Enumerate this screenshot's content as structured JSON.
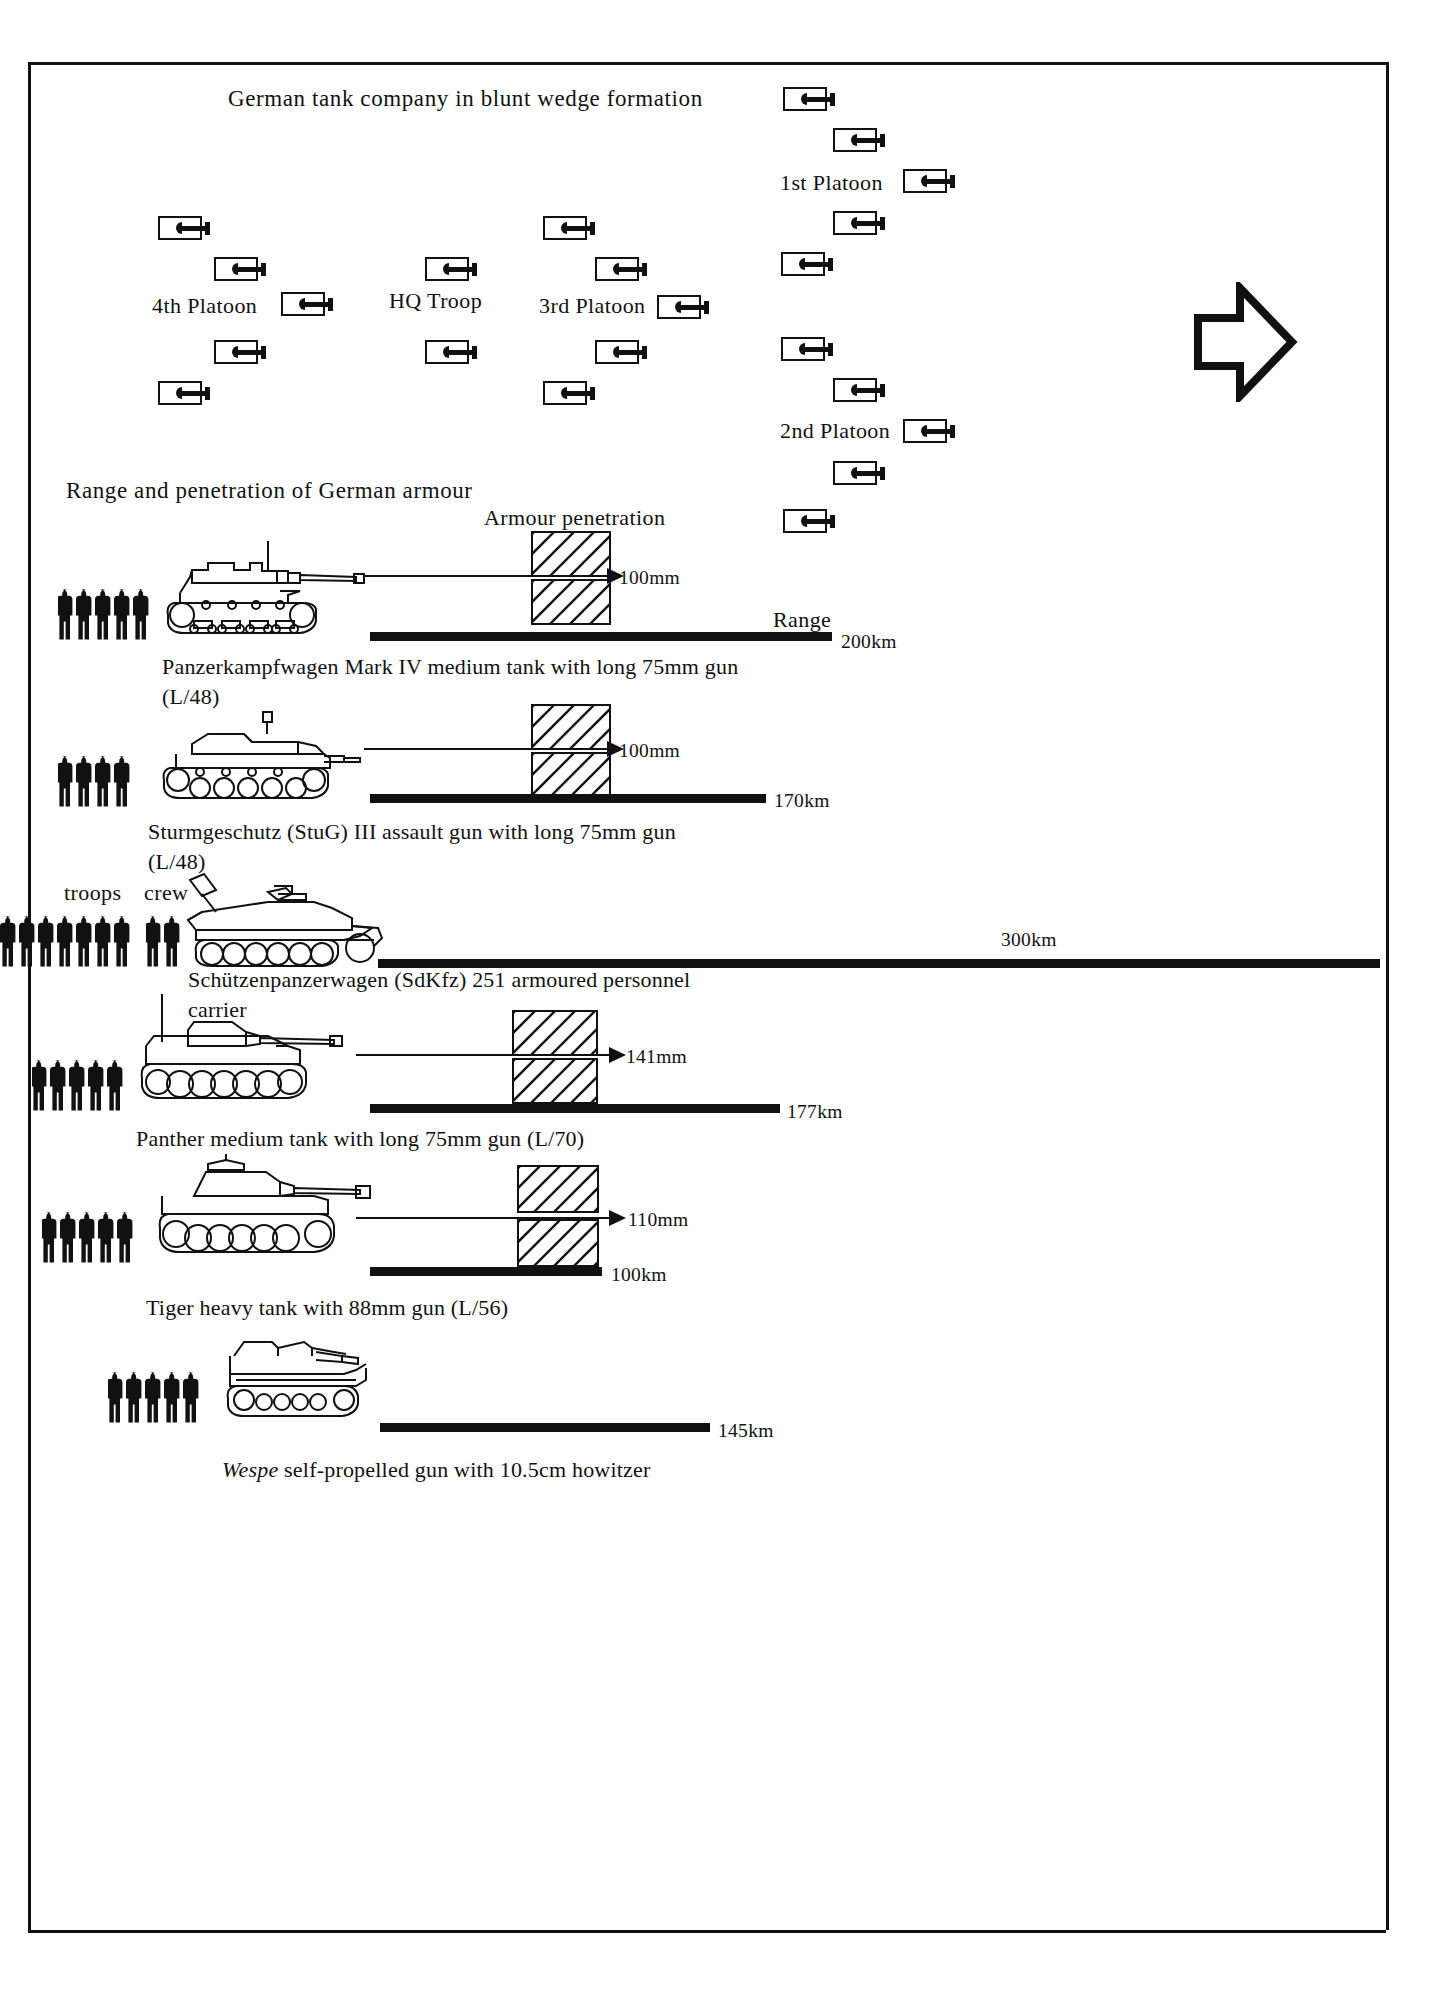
{
  "page": {
    "background": "#ffffff",
    "ink": "#111111"
  },
  "formation": {
    "title": "German tank company in blunt wedge formation",
    "direction_arrow": "right-arrow",
    "labels": [
      {
        "text": "1st Platoon",
        "x": 780,
        "y": 170
      },
      {
        "text": "4th Platoon",
        "x": 152,
        "y": 296
      },
      {
        "text": "HQ Troop",
        "x": 389,
        "y": 291
      },
      {
        "text": "3rd Platoon",
        "x": 539,
        "y": 296
      },
      {
        "text": "2nd Platoon",
        "x": 780,
        "y": 420
      }
    ],
    "units": [
      {
        "group": "1st Platoon",
        "x": 783,
        "y": 87
      },
      {
        "group": "1st Platoon",
        "x": 833,
        "y": 128
      },
      {
        "group": "1st Platoon",
        "x": 903,
        "y": 169
      },
      {
        "group": "1st Platoon",
        "x": 833,
        "y": 211
      },
      {
        "group": "1st Platoon",
        "x": 781,
        "y": 252
      },
      {
        "group": "2nd Platoon",
        "x": 781,
        "y": 337
      },
      {
        "group": "2nd Platoon",
        "x": 833,
        "y": 378
      },
      {
        "group": "2nd Platoon",
        "x": 903,
        "y": 419
      },
      {
        "group": "2nd Platoon",
        "x": 833,
        "y": 461
      },
      {
        "group": "2nd Platoon",
        "x": 783,
        "y": 509
      },
      {
        "group": "3rd Platoon",
        "x": 543,
        "y": 216
      },
      {
        "group": "3rd Platoon",
        "x": 595,
        "y": 257
      },
      {
        "group": "3rd Platoon",
        "x": 657,
        "y": 295
      },
      {
        "group": "3rd Platoon",
        "x": 595,
        "y": 340
      },
      {
        "group": "3rd Platoon",
        "x": 543,
        "y": 381
      },
      {
        "group": "HQ Troop",
        "x": 425,
        "y": 257
      },
      {
        "group": "HQ Troop",
        "x": 425,
        "y": 340
      },
      {
        "group": "4th Platoon",
        "x": 158,
        "y": 216
      },
      {
        "group": "4th Platoon",
        "x": 214,
        "y": 257
      },
      {
        "group": "4th Platoon",
        "x": 281,
        "y": 292
      },
      {
        "group": "4th Platoon",
        "x": 214,
        "y": 340
      },
      {
        "group": "4th Platoon",
        "x": 158,
        "y": 381
      }
    ]
  },
  "armour": {
    "section_title": "Range and penetration of German armour",
    "penetration_header": "Armour penetration",
    "range_header": "Range",
    "troops_label": "troops",
    "crew_label": "crew",
    "vehicles": [
      {
        "id": "panzer-iv",
        "caption": "Panzerkampfwagen Mark IV medium tank with long 75mm gun (L/48)",
        "penetration": "100mm",
        "range": "200km",
        "crew_figures": 5,
        "troop_figures": 0,
        "has_penetration": true
      },
      {
        "id": "stug-iii",
        "caption": "Sturmgeschutz (StuG) III assault gun with long 75mm gun (L/48)",
        "penetration": "100mm",
        "range": "170km",
        "crew_figures": 4,
        "troop_figures": 0,
        "has_penetration": true
      },
      {
        "id": "sdkfz-251",
        "caption": "Schützenpanzerwagen (SdKfz) 251 armoured personnel carrier",
        "penetration": "",
        "range": "300km",
        "crew_figures": 2,
        "troop_figures": 8,
        "has_penetration": false
      },
      {
        "id": "panther",
        "caption": "Panther medium tank with long 75mm gun (L/70)",
        "penetration": "141mm",
        "range": "177km",
        "crew_figures": 5,
        "troop_figures": 0,
        "has_penetration": true
      },
      {
        "id": "tiger",
        "caption": "Tiger heavy tank with 88mm gun (L/56)",
        "penetration": "110mm",
        "range": "100km",
        "crew_figures": 5,
        "troop_figures": 0,
        "has_penetration": true
      },
      {
        "id": "wespe",
        "caption_italic": "Wespe",
        "caption": " self-propelled gun with 10.5cm howitzer",
        "penetration": "",
        "range": "145km",
        "crew_figures": 5,
        "troop_figures": 0,
        "has_penetration": false
      }
    ]
  },
  "chart_data": {
    "type": "bar",
    "title": "Range and penetration of German armour",
    "xlabel": "Range",
    "ylabel": "",
    "categories": [
      "Panzerkampfwagen Mark IV",
      "Sturmgeschutz (StuG) III",
      "Schützenpanzerwagen (SdKfz) 251",
      "Panther",
      "Tiger",
      "Wespe"
    ],
    "series": [
      {
        "name": "Range (km)",
        "values": [
          200,
          170,
          300,
          177,
          100,
          145
        ]
      },
      {
        "name": "Armour penetration (mm)",
        "values": [
          100,
          100,
          null,
          141,
          110,
          null
        ]
      },
      {
        "name": "Crew",
        "values": [
          5,
          4,
          2,
          5,
          5,
          5
        ]
      },
      {
        "name": "Troops carried",
        "values": [
          0,
          0,
          8,
          0,
          0,
          0
        ]
      }
    ],
    "range_labels": [
      "200km",
      "170km",
      "300km",
      "177km",
      "100km",
      "145km"
    ],
    "penetration_labels": [
      "100mm",
      "100mm",
      "",
      "141mm",
      "110mm",
      ""
    ],
    "grid": false,
    "legend": "none"
  }
}
